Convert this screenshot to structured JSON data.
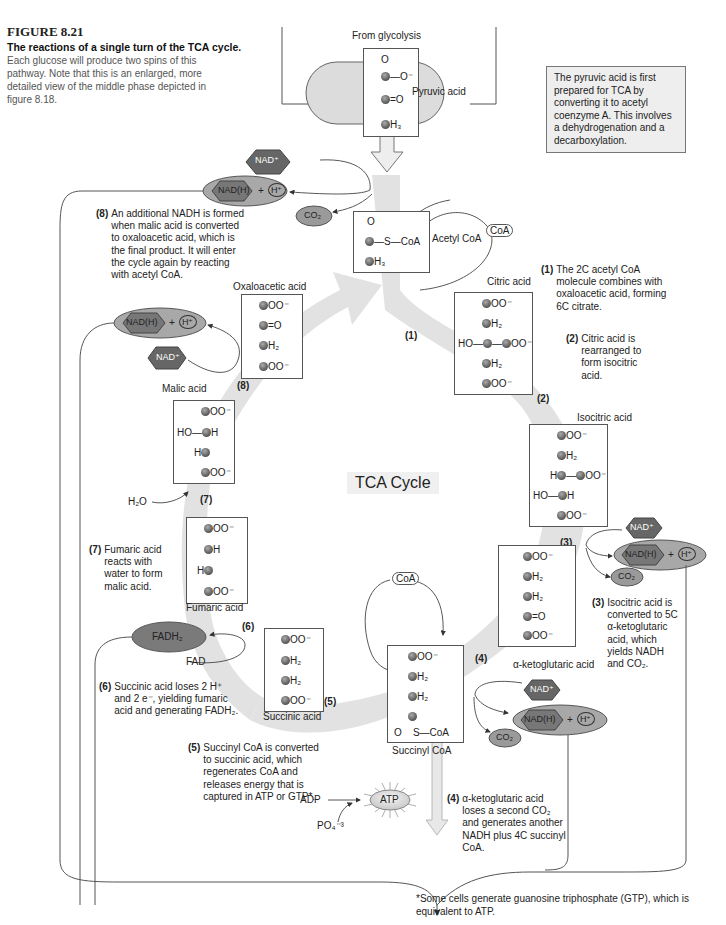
{
  "figure": {
    "number": "FIGURE 8.21",
    "title": "The reactions of a single turn of the TCA cycle.",
    "description": "Each glucose will produce two spins of this pathway. Note that this is an enlarged, more detailed view of the middle phase depicted in figure 8.18."
  },
  "top": {
    "from_label": "From glycolysis",
    "pyruvic_label": "Pyruvic acid",
    "info_box": "The pyruvic acid is first prepared for TCA by converting it to acetyl coenzyme A. This involves a dehydrogenation and a decarboxylation."
  },
  "center_label": "TCA Cycle",
  "molecules": {
    "pyruvic": {
      "rows": [
        "O",
        "C—O⁻",
        "C=O",
        "CH₃"
      ]
    },
    "acetyl_coa": {
      "name": "Acetyl CoA",
      "rows": [
        "O",
        "C—S—CoA",
        "CH₃"
      ]
    },
    "citric": {
      "name": "Citric acid",
      "rows": [
        "COO⁻",
        "CH₂",
        "HO—C—COO⁻",
        "CH₂",
        "COO⁻"
      ]
    },
    "isocitric": {
      "name": "Isocitric acid",
      "rows": [
        "COO⁻",
        "CH₂",
        "HC—COO⁻",
        "HO—CH",
        "COO⁻"
      ]
    },
    "ketoglutaric": {
      "name": "α-ketoglutaric acid",
      "rows": [
        "COO⁻",
        "CH₂",
        "CH₂",
        "C=O",
        "COO⁻"
      ]
    },
    "succinyl_coa": {
      "name": "Succinyl CoA",
      "rows": [
        "COO⁻",
        "CH₂",
        "CH₂",
        "C",
        "O   S—CoA"
      ]
    },
    "succinic": {
      "name": "Succinic acid",
      "rows": [
        "COO⁻",
        "CH₂",
        "CH₂",
        "COO⁻"
      ]
    },
    "fumaric": {
      "name": "Fumaric acid",
      "rows": [
        "COO⁻",
        "CH",
        "HC",
        "COO⁻"
      ]
    },
    "malic": {
      "name": "Malic acid",
      "rows": [
        "COO⁻",
        "HO—CH",
        "HC",
        "COO⁻"
      ]
    },
    "oxaloacetic": {
      "name": "Oxaloacetic acid",
      "rows": [
        "COO⁻",
        "C=O",
        "CH₂",
        "COO⁻"
      ]
    }
  },
  "cofactors": {
    "nad_plus": "NAD⁺",
    "nadh": "NAD(H)",
    "plus": "+",
    "h_plus": "H⁺",
    "co2": "CO₂",
    "coa": "CoA",
    "fadh2": "FADH₂",
    "fad": "FAD",
    "h2o": "H₂O",
    "adp": "ADP",
    "po4": "PO₄⁻³",
    "atp": "ATP"
  },
  "step_labels": [
    "(1)",
    "(2)",
    "(3)",
    "(4)",
    "(5)",
    "(6)",
    "(7)",
    "(8)"
  ],
  "steps": [
    {
      "num": "(1)",
      "text": "The 2C acetyl CoA molecule combines with oxaloacetic acid, forming 6C citrate."
    },
    {
      "num": "(2)",
      "text": "Citric acid is rearranged to form isocitric acid."
    },
    {
      "num": "(3)",
      "text": "Isocitric acid is converted to 5C α-ketoglutaric acid, which yields NADH and CO₂."
    },
    {
      "num": "(4)",
      "text": "α-ketoglutaric acid loses a second CO₂ and generates another NADH plus 4C succinyl CoA."
    },
    {
      "num": "(5)",
      "text": "Succinyl CoA is converted to succinic acid, which regenerates CoA and releases energy that is captured in ATP or GTP*."
    },
    {
      "num": "(6)",
      "text": "Succinic acid loses 2 H⁺ and 2 e⁻, yielding fumaric acid and generating FADH₂."
    },
    {
      "num": "(7)",
      "text": "Fumaric acid reacts with water to form malic acid."
    },
    {
      "num": "(8)",
      "text": "An additional NADH is formed when malic acid is converted to oxaloacetic acid, which is the final product. It will enter the cycle again by reacting with acetyl CoA."
    }
  ],
  "footnote": "*Some cells generate guanosine triphosphate (GTP), which is equivalent to ATP.",
  "colors": {
    "cycle_arrow": "#e0e0e0",
    "nad_hex": "#666666",
    "nadh_oval": "#a8a8a8",
    "co2_oval": "#9a9a9a",
    "fadh2_oval": "#7a7a7a",
    "info_box_bg": "#eeeeee"
  }
}
